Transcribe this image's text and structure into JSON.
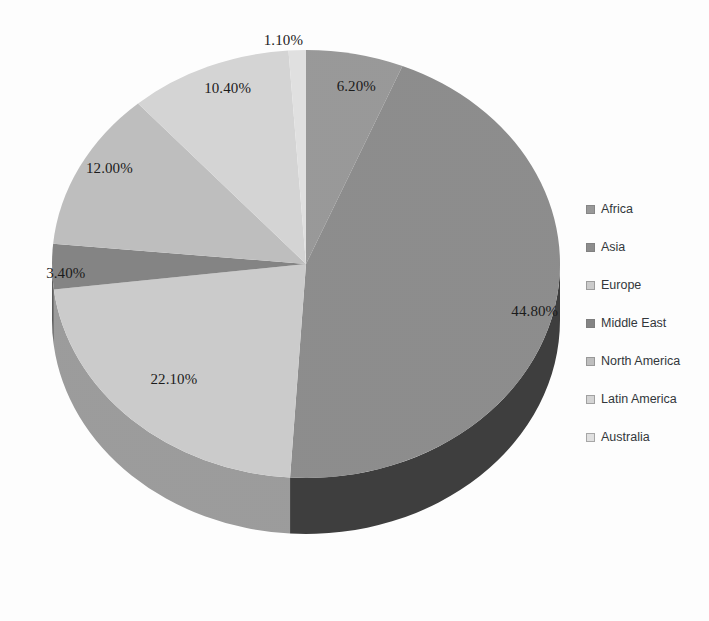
{
  "chart_data": {
    "type": "pie",
    "title": "",
    "subtitle": "",
    "xlabel": "",
    "ylabel": "",
    "grid": false,
    "legend_position": "right",
    "three_d": true,
    "start_angle_deg": 0,
    "direction": "clockwise",
    "categories": [
      "Africa",
      "Asia",
      "Europe",
      "Middle East",
      "North America",
      "Latin America",
      "Australia"
    ],
    "values": [
      6.2,
      44.8,
      22.1,
      3.4,
      12.0,
      10.4,
      1.1
    ],
    "value_unit": "%",
    "total": 100.0,
    "data_labels": [
      "6.20%",
      "44.80%",
      "22.10%",
      "3.40%",
      "12.00%",
      "10.40%",
      "1.10%"
    ],
    "slice_colors": [
      "#9a9a9a",
      "#8e8e8e",
      "#cdcdcd",
      "#858585",
      "#c0c0c0",
      "#d6d6d6",
      "#e2e2e2"
    ],
    "slice_side_colors": [
      "#6f6f6f",
      "#3f3f3f",
      "#9d9d9d",
      "#5e5e5e",
      "#8f8f8f",
      "#a5a5a5",
      "#b4b4b4"
    ],
    "series": [
      {
        "name": "Share",
        "values": [
          6.2,
          44.8,
          22.1,
          3.4,
          12.0,
          10.4,
          1.1
        ]
      }
    ],
    "points": [
      {
        "category": "Africa",
        "value": 6.2,
        "label": "6.20%",
        "color": "#9a9a9a"
      },
      {
        "category": "Asia",
        "value": 44.8,
        "label": "44.80%",
        "color": "#8e8e8e"
      },
      {
        "category": "Europe",
        "value": 22.1,
        "label": "22.10%",
        "color": "#cdcdcd"
      },
      {
        "category": "Middle East",
        "value": 3.4,
        "label": "3.40%",
        "color": "#858585"
      },
      {
        "category": "North America",
        "value": 12.0,
        "label": "12.00%",
        "color": "#c0c0c0"
      },
      {
        "category": "Latin America",
        "value": 10.4,
        "label": "10.40%",
        "color": "#d6d6d6"
      },
      {
        "category": "Australia",
        "value": 1.1,
        "label": "1.10%",
        "color": "#e2e2e2"
      }
    ]
  },
  "labels": {
    "africa": "6.20%",
    "asia": "44.80%",
    "europe": "22.10%",
    "middle_east": "3.40%",
    "north_america": "12.00%",
    "latin_america": "10.40%",
    "australia": "1.10%"
  },
  "legend": {
    "items": [
      {
        "label": "Africa",
        "color": "#9a9a9a"
      },
      {
        "label": "Asia",
        "color": "#8e8e8e"
      },
      {
        "label": "Europe",
        "color": "#cdcdcd"
      },
      {
        "label": "Middle East",
        "color": "#858585"
      },
      {
        "label": "North America",
        "color": "#c0c0c0"
      },
      {
        "label": "Latin America",
        "color": "#d6d6d6"
      },
      {
        "label": "Australia",
        "color": "#e2e2e2"
      }
    ]
  }
}
